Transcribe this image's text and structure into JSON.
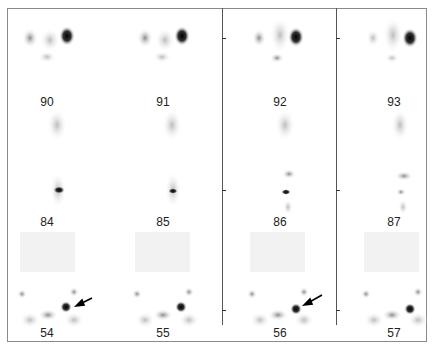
{
  "figure": {
    "rows": [
      {
        "name": "row-top",
        "slices": [
          "90",
          "91",
          "92",
          "93"
        ]
      },
      {
        "name": "row-middle",
        "slices": [
          "84",
          "85",
          "86",
          "87"
        ]
      },
      {
        "name": "row-bottom",
        "slices": [
          "54",
          "55",
          "56",
          "57"
        ]
      }
    ],
    "arrows_on": [
      "54",
      "56"
    ]
  }
}
